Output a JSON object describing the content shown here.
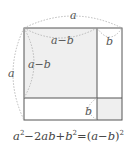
{
  "diagram": {
    "colors": {
      "line": "#555555",
      "shade": "#efefef",
      "arc": "#aaaaaa",
      "text": "#555555"
    },
    "regions": [
      {
        "name": "square-a-minus-b",
        "shaded": true
      },
      {
        "name": "rect-top-right",
        "shaded": false
      },
      {
        "name": "rect-bottom-left",
        "shaded": false
      },
      {
        "name": "square-b",
        "shaded": true
      }
    ],
    "labels": {
      "top_a": "a",
      "left_a": "a",
      "top_a_minus_b": "a−b",
      "left_a_minus_b": "a−b",
      "top_b": "b",
      "inner_b": "b"
    }
  },
  "caption": {
    "formula_parts": [
      "a",
      "2",
      "−2",
      "ab",
      "+",
      "b",
      "2",
      "=(",
      "a",
      "−",
      "b",
      ")",
      "2"
    ],
    "text": "a²−2ab+b²=(a−b)²"
  }
}
